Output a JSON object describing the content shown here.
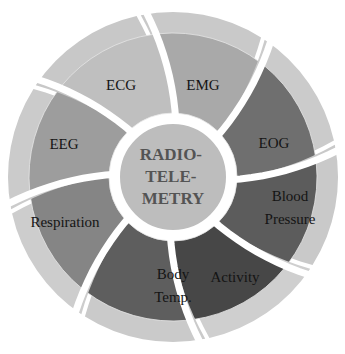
{
  "center": {
    "lines": [
      "RADIO-",
      "TELE-",
      "METRY"
    ],
    "color": "#bdbdbd"
  },
  "segments": [
    {
      "lines": [
        "EMG"
      ],
      "color": "#a9a9a9",
      "ring_color": "#c9c9c9"
    },
    {
      "lines": [
        "EOG"
      ],
      "color": "#6f6f6f",
      "ring_color": "#cbcbcb"
    },
    {
      "lines": [
        "Blood",
        "Pressure"
      ],
      "color": "#5c5c5c",
      "ring_color": "#c9c9c9"
    },
    {
      "lines": [
        "Activity"
      ],
      "color": "#474747",
      "ring_color": "#cfcfcf"
    },
    {
      "lines": [
        "Body",
        "Temp."
      ],
      "color": "#5e5e5e",
      "ring_color": "#cacaca"
    },
    {
      "lines": [
        "Respiration"
      ],
      "color": "#858585",
      "ring_color": "#cdcdcd"
    },
    {
      "lines": [
        "EEG"
      ],
      "color": "#9d9d9d",
      "ring_color": "#cbcbcb"
    },
    {
      "lines": [
        "ECG"
      ],
      "color": "#bfbfbf",
      "ring_color": "#c8c8c8"
    }
  ]
}
